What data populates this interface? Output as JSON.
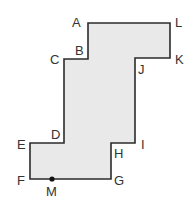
{
  "diagram": {
    "type": "polygon-figure",
    "fill_color": "#e9e9e9",
    "stroke_color": "#2b2b2b",
    "vertices": [
      {
        "name": "A",
        "x": 88,
        "y": 23,
        "label_x": 72,
        "label_y": 27
      },
      {
        "name": "L",
        "x": 170,
        "y": 23,
        "label_x": 175,
        "label_y": 27
      },
      {
        "name": "K",
        "x": 170,
        "y": 58,
        "label_x": 175,
        "label_y": 64
      },
      {
        "name": "J",
        "x": 135,
        "y": 58,
        "label_x": 138,
        "label_y": 74
      },
      {
        "name": "I",
        "x": 135,
        "y": 143,
        "label_x": 141,
        "label_y": 149
      },
      {
        "name": "H",
        "x": 111,
        "y": 143,
        "label_x": 114,
        "label_y": 158
      },
      {
        "name": "G",
        "x": 111,
        "y": 179,
        "label_x": 114,
        "label_y": 185
      },
      {
        "name": "F",
        "x": 30,
        "y": 179,
        "label_x": 17,
        "label_y": 185
      },
      {
        "name": "E",
        "x": 30,
        "y": 143,
        "label_x": 17,
        "label_y": 149
      },
      {
        "name": "D",
        "x": 64,
        "y": 143,
        "label_x": 51,
        "label_y": 139
      },
      {
        "name": "C",
        "x": 64,
        "y": 59,
        "label_x": 50,
        "label_y": 64
      },
      {
        "name": "B",
        "x": 88,
        "y": 59,
        "label_x": 75,
        "label_y": 55
      }
    ],
    "points": [
      {
        "name": "M",
        "x": 52,
        "y": 179,
        "label_x": 46,
        "label_y": 196
      }
    ]
  }
}
